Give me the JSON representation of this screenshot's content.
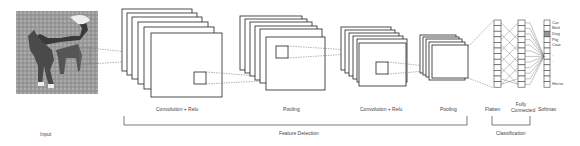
{
  "diagram": {
    "input": {
      "label": "Input",
      "image": "dog-photo"
    },
    "stages": [
      {
        "label": "Convolution + Relu"
      },
      {
        "label": "Pooling"
      },
      {
        "label": "Convolution + Relu"
      },
      {
        "label": "Pooling"
      },
      {
        "label": "Flatten"
      },
      {
        "label": "Fully Connected"
      },
      {
        "label": "Softmax"
      }
    ],
    "groups": {
      "feature_detection": "Feature Detection",
      "classification": "Classification"
    },
    "softmax_classes": [
      "Cat",
      "Bird",
      "Dog",
      "Pig",
      "Cow",
      "·",
      "·",
      "Horse"
    ],
    "highlighted_class": "Dog",
    "highlight_color": "#999999"
  }
}
